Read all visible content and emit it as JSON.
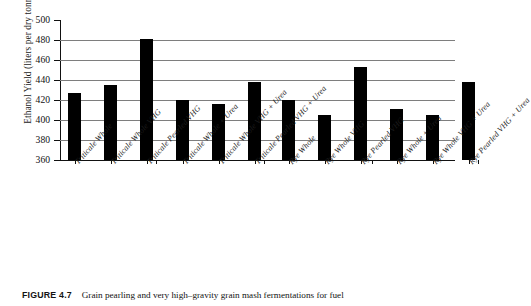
{
  "figure": {
    "caption_label": "FIGURE 4.7",
    "caption_text": "Grain pearling and very high–gravity grain mash fermentations for fuel"
  },
  "axis": {
    "y_title": "Ethanol Yield (liters per dry tonne)",
    "y_ticks": [
      "500",
      "480",
      "460",
      "440",
      "420",
      "400",
      "380",
      "360"
    ]
  },
  "chart_data": {
    "type": "bar",
    "title": "",
    "xlabel": "",
    "ylabel": "Ethanol Yield (liters per dry tonne)",
    "ylim": [
      360,
      500
    ],
    "ytick_step": 20,
    "grid": true,
    "legend": "none",
    "bar_color": "#000000",
    "categories": [
      "Triticale Whole",
      "Triticale Whole VHG",
      "Triticale Pearled VHG",
      "Triticale Whole + Urea",
      "Triticale Whole VHG + Urea",
      "Triticale Pearled VHG + Urea",
      "Rye Whole",
      "Rye Whole VHG",
      "Rye Pearled VHG",
      "Rye Whole + Urea",
      "Rye Whole VHG + Urea",
      "Rye Pearled VHG + Urea"
    ],
    "values": [
      427,
      435,
      481,
      420,
      416,
      438,
      420,
      405,
      453,
      411,
      405,
      438
    ],
    "groups": [
      {
        "name": "Triticale",
        "indices": [
          0,
          1,
          2
        ]
      },
      {
        "name": "Triticale + Urea",
        "indices": [
          3,
          4,
          5
        ]
      },
      {
        "name": "Rye",
        "indices": [
          6,
          7,
          8
        ]
      },
      {
        "name": "Rye + Urea",
        "indices": [
          9,
          10,
          11
        ]
      }
    ]
  }
}
